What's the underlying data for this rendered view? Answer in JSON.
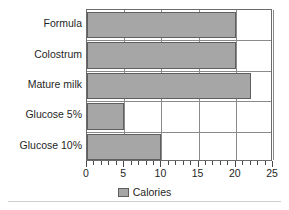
{
  "chart_data": {
    "type": "bar",
    "orientation": "horizontal",
    "title": "",
    "xlabel": "",
    "ylabel": "",
    "categories": [
      "Formula",
      "Colostrum",
      "Mature milk",
      "Glucose 5%",
      "Glucose 10%"
    ],
    "values": [
      20,
      20,
      22,
      5,
      10
    ],
    "series": [
      {
        "name": "Calories",
        "values": [
          20,
          20,
          22,
          5,
          10
        ],
        "color": "#a6a6a6"
      }
    ],
    "xlim": [
      0,
      25
    ],
    "xticks": [
      0,
      5,
      10,
      15,
      20,
      25
    ],
    "xtick_labels": [
      "0",
      "5",
      "10",
      "15",
      "20",
      "25"
    ],
    "minor_tick_step": 1,
    "grid": "vertical-major",
    "legend": {
      "position": "bottom-center",
      "entries": [
        {
          "label": "Calories",
          "color": "#a6a6a6"
        }
      ]
    },
    "colors": {
      "bar_fill": "#a6a6a6",
      "bar_edge": "#5f5f5f",
      "axis": "#6b6b6b",
      "grid": "#8a8a8a",
      "text": "#1f1f1f",
      "background": "#ffffff"
    }
  }
}
